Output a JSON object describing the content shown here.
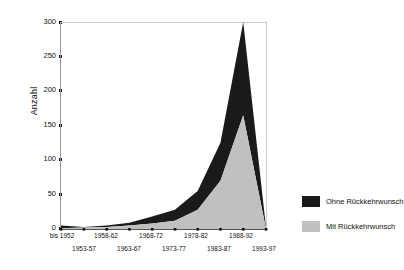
{
  "chart_data": {
    "type": "area",
    "title": "",
    "xlabel": "",
    "ylabel": "Anzahl",
    "stacked": true,
    "grid": false,
    "ylim": [
      0,
      300
    ],
    "yticks": [
      0,
      50,
      100,
      150,
      200,
      250,
      300
    ],
    "categories": [
      "bis 1952",
      "1953-57",
      "1958-62",
      "1963-67",
      "1968-72",
      "1973-77",
      "1978-82",
      "1983-87",
      "1988-92",
      "1993-97"
    ],
    "legend_position": "right",
    "series": [
      {
        "name": "Mit Rückkehrwunsch",
        "color": "#c0c0c0",
        "values": [
          1,
          2,
          3,
          5,
          8,
          12,
          28,
          70,
          165,
          0
        ]
      },
      {
        "name": "Ohne Rückkehrwunsch",
        "color": "#1a1a1a",
        "values": [
          4,
          1,
          2,
          4,
          10,
          16,
          27,
          55,
          135,
          2
        ]
      }
    ],
    "totals": [
      5,
      3,
      5,
      9,
      18,
      28,
      55,
      125,
      300,
      2
    ]
  },
  "axis": {
    "y_title": "Anzahl",
    "y_tick_labels": [
      "300",
      "250",
      "200",
      "150",
      "100",
      "50",
      "0"
    ],
    "x_tick_labels_top": [
      "bis 1952",
      "1958-62",
      "1968-72",
      "1978-82",
      "1988-92"
    ],
    "x_tick_labels_bottom": [
      "1953-57",
      "1963-67",
      "1973-77",
      "1983-87",
      "1993-97"
    ]
  },
  "legend": {
    "items": [
      {
        "label": "Ohne Rückkehrwunsch",
        "color": "#1a1a1a"
      },
      {
        "label": "Mit Rückkehrwunsch",
        "color": "#c0c0c0"
      }
    ]
  }
}
